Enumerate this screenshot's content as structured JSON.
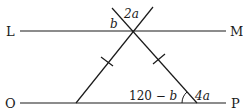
{
  "diagram": {
    "type": "geometry",
    "points": {
      "L": "L",
      "M": "M",
      "O": "O",
      "P": "P"
    },
    "angles": {
      "top_left": "b",
      "top_vertical": "2a",
      "base_interior": "120 − b",
      "base_exterior": "4a"
    },
    "marks": {
      "equal_sides": "tick marks on both legs of the triangle"
    },
    "colors": {
      "stroke": "#1a1a1a",
      "background": "#ffffff"
    }
  }
}
